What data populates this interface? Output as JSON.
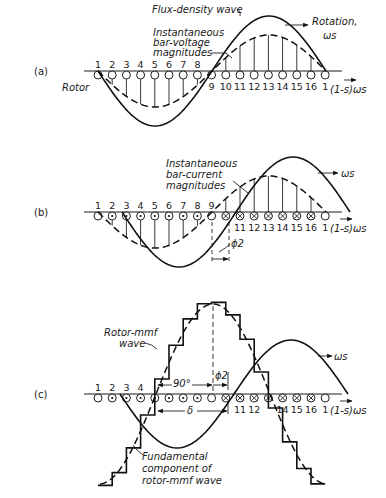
{
  "figure": {
    "width": 386,
    "height": 498,
    "slot_spacing": 14.2,
    "first_slot_x": 98,
    "slot_labels": [
      "1",
      "2",
      "3",
      "4",
      "5",
      "6",
      "7",
      "8",
      "9",
      "10",
      "11",
      "12",
      "13",
      "14",
      "15",
      "16",
      "1"
    ]
  },
  "panels": [
    {
      "id": "a",
      "label": "(a)",
      "axis_y": 71,
      "rotor_label": "Rotor",
      "hidden_slot_labels": [],
      "slot_label_above_until": 8,
      "conductor_marks": [
        "o",
        "o",
        "o",
        "o",
        "o",
        "o",
        "o",
        "o",
        "o",
        "o",
        "o",
        "o",
        "o",
        "o",
        "o",
        "o",
        "o"
      ],
      "flux_wave": {
        "zero_x": 98,
        "half_period": 114,
        "amplitude": 55,
        "x_start": 98,
        "x_end": 326,
        "sign": -1
      },
      "dashed_wave": {
        "zero_x": 98,
        "half_period": 114,
        "amplitude": 36,
        "x_start": 98,
        "x_end": 326,
        "sign": -1
      },
      "annotations": {
        "flux_density": "Flux-density wave",
        "rotation": "Rotation,",
        "omega_s": "ωs",
        "inst_1": "Instantaneous",
        "inst_2": "bar-voltage",
        "inst_3": "magnitudes",
        "slip_speed": "(1-s)ωs"
      }
    },
    {
      "id": "b",
      "label": "(b)",
      "axis_y": 212,
      "conductor_marks": [
        "o",
        "dot",
        "dot",
        "dot",
        "dot",
        "dot",
        "dot",
        "dot",
        "o",
        "x",
        "x",
        "x",
        "x",
        "x",
        "x",
        "x",
        "o"
      ],
      "slot_label_above_until": 9,
      "hidden_slot_labels": [
        "10"
      ],
      "flux_wave": {
        "zero_x": 122,
        "half_period": 114,
        "amplitude": 55,
        "x_start": 122,
        "x_end": 350,
        "sign": -1
      },
      "dashed_wave": {
        "zero_x": 98,
        "half_period": 114,
        "amplitude": 36,
        "x_start": 98,
        "x_end": 326,
        "sign": -1
      },
      "annotations": {
        "omega_s": "ωs",
        "inst_1": "Instantaneous",
        "inst_2": "bar-current",
        "inst_3": "magnitudes",
        "phi": "ϕ2",
        "slip_speed": "(1-s)ωs"
      }
    },
    {
      "id": "c",
      "label": "(c)",
      "axis_y": 394,
      "conductor_marks": [
        "o",
        "dot",
        "dot",
        "dot",
        "dot",
        "dot",
        "dot",
        "dot",
        "o",
        "x",
        "x",
        "x",
        "x",
        "x",
        "x",
        "x",
        "o"
      ],
      "slot_label_above_until": 4,
      "hidden_slot_labels": [
        "5",
        "6",
        "7",
        "8",
        "9",
        "10",
        "13"
      ],
      "flux_wave": {
        "zero_x": 120,
        "half_period": 114,
        "amplitude": 54,
        "x_start": 120,
        "x_end": 348,
        "sign": -1
      },
      "mmf_fundamental": {
        "center_x": 213,
        "half_period": 114,
        "amplitude": 90
      },
      "annotations": {
        "rotor_mmf_1": "Rotor-mmf",
        "rotor_mmf_2": "wave",
        "omega_s": "ωs",
        "ninety": "90°",
        "phi": "ϕ2",
        "delta": "δ",
        "fund_1": "Fundamental",
        "fund_2": "component of",
        "fund_3": "rotor-mmf wave",
        "slip_speed": "(1-s)ωs"
      }
    }
  ],
  "chart_data": {
    "type": "diagram",
    "title": "",
    "panels": [
      "(a) flux-density wave and instantaneous bar-voltage magnitudes",
      "(b) instantaneous bar-current magnitudes lagging by ϕ2",
      "(c) stepped rotor-mmf wave and its fundamental component, displaced δ = 90° + ϕ2"
    ],
    "rotor_bars": 16
  }
}
